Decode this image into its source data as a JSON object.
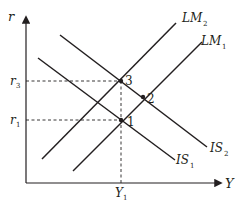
{
  "diagram": {
    "type": "IS-LM",
    "axes": {
      "x_label": "Y",
      "y_label": "r",
      "x_ticks": [
        {
          "label": "Y",
          "sub": "1"
        }
      ],
      "y_ticks": [
        {
          "label": "r",
          "sub": "3"
        },
        {
          "label": "r",
          "sub": "1"
        }
      ]
    },
    "curves": [
      {
        "name": "LM",
        "sub": "2",
        "kind": "upward-sloping"
      },
      {
        "name": "LM",
        "sub": "1",
        "kind": "upward-sloping"
      },
      {
        "name": "IS",
        "sub": "2",
        "kind": "downward-sloping"
      },
      {
        "name": "IS",
        "sub": "1",
        "kind": "downward-sloping"
      }
    ],
    "points": [
      {
        "label": "1",
        "at": "IS1 ∩ LM2",
        "x": "Y1",
        "y": "r1"
      },
      {
        "label": "2",
        "at": "IS2 ∩ LM1"
      },
      {
        "label": "3",
        "at": "IS2 ∩ LM2",
        "x": "Y1",
        "y": "r3"
      }
    ],
    "colors": {
      "ink": "#231f20",
      "background": "#ffffff"
    }
  }
}
